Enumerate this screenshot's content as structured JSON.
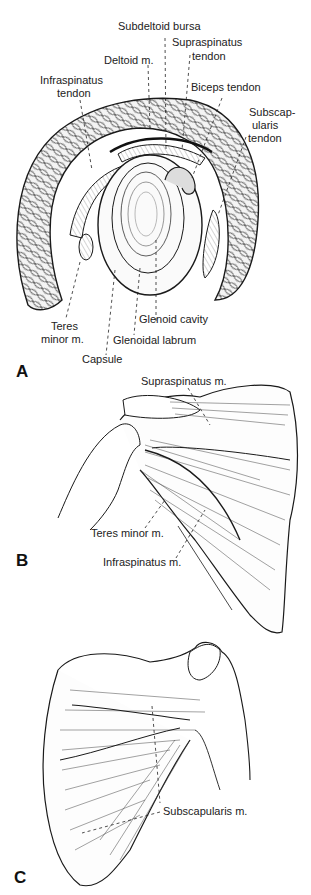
{
  "figure": {
    "panels": [
      {
        "id": "A",
        "letter": "A",
        "labels": {
          "subdeltoid_bursa": "Subdeltoid bursa",
          "supraspinatus_tendon_1": "Supraspinatus",
          "supraspinatus_tendon_2": "tendon",
          "deltoid": "Deltoid m.",
          "infraspinatus_tendon_1": "Infraspinatus",
          "infraspinatus_tendon_2": "tendon",
          "biceps_tendon": "Biceps tendon",
          "subscapularis_tendon_1": "Subscap-",
          "subscapularis_tendon_2": "ularis",
          "subscapularis_tendon_3": "tendon",
          "teres_minor_1": "Teres",
          "teres_minor_2": "minor m.",
          "glenoid_cavity": "Glenoid cavity",
          "glenoidal_labrum": "Glenoidal labrum",
          "capsule": "Capsule"
        }
      },
      {
        "id": "B",
        "letter": "B",
        "labels": {
          "supraspinatus_m": "Supraspinatus m.",
          "teres_minor_m": "Teres minor m.",
          "infraspinatus_m": "Infraspinatus m."
        }
      },
      {
        "id": "C",
        "letter": "C",
        "labels": {
          "subscapularis_m": "Subscapularis m."
        }
      }
    ],
    "colors": {
      "ink": "#1a1a1a",
      "background": "#ffffff"
    }
  }
}
